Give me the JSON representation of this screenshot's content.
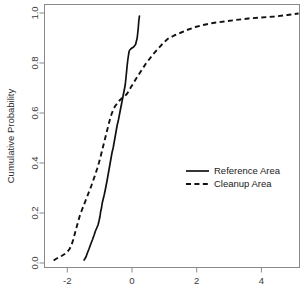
{
  "chart_data": {
    "type": "line",
    "title": "",
    "subtitle": "",
    "xlabel": "",
    "ylabel": "Cumulative Probability",
    "xlim": [
      -2.72,
      5.2
    ],
    "ylim": [
      0.0,
      1.0
    ],
    "grid": false,
    "legend_position": "center-right",
    "xticks": [
      -2,
      0,
      2,
      4
    ],
    "xtick_labels": [
      "-2",
      "0",
      "2",
      "4"
    ],
    "yticks": [
      0.0,
      0.2,
      0.4,
      0.6,
      0.8,
      1.0
    ],
    "ytick_labels": [
      "0.0",
      "0.2",
      "0.4",
      "0.6",
      "0.8",
      "1.0"
    ],
    "series": [
      {
        "name": "Reference Area",
        "style": "solid",
        "color": "#111111",
        "x": [
          -1.48,
          -1.42,
          -1.38,
          -1.33,
          -1.28,
          -1.22,
          -1.17,
          -1.13,
          -1.09,
          -1.05,
          -1.02,
          -0.99,
          -0.97,
          -0.94,
          -0.92,
          -0.89,
          -0.86,
          -0.83,
          -0.8,
          -0.77,
          -0.74,
          -0.71,
          -0.68,
          -0.65,
          -0.62,
          -0.58,
          -0.55,
          -0.52,
          -0.49,
          -0.46,
          -0.42,
          -0.39,
          -0.36,
          -0.33,
          -0.3,
          -0.27,
          -0.24,
          -0.21,
          -0.19,
          -0.17,
          -0.15,
          -0.13,
          -0.11,
          -0.09,
          -0.07,
          -0.04,
          0.0,
          0.05,
          0.11,
          0.16,
          0.19,
          0.21,
          0.23
        ],
        "y": [
          0.012,
          0.025,
          0.04,
          0.056,
          0.074,
          0.094,
          0.112,
          0.128,
          0.14,
          0.152,
          0.168,
          0.186,
          0.205,
          0.222,
          0.24,
          0.256,
          0.272,
          0.29,
          0.31,
          0.33,
          0.352,
          0.374,
          0.396,
          0.418,
          0.44,
          0.462,
          0.484,
          0.506,
          0.528,
          0.55,
          0.572,
          0.592,
          0.612,
          0.632,
          0.652,
          0.672,
          0.692,
          0.712,
          0.736,
          0.762,
          0.79,
          0.812,
          0.83,
          0.846,
          0.852,
          0.856,
          0.86,
          0.864,
          0.874,
          0.9,
          0.935,
          0.968,
          0.988
        ]
      },
      {
        "name": "Cleanup Area",
        "style": "dashed",
        "color": "#111111",
        "x": [
          -2.42,
          -2.38,
          -2.3,
          -2.18,
          -2.08,
          -2.0,
          -1.93,
          -1.87,
          -1.82,
          -1.77,
          -1.72,
          -1.67,
          -1.62,
          -1.56,
          -1.5,
          -1.44,
          -1.38,
          -1.32,
          -1.26,
          -1.2,
          -1.14,
          -1.08,
          -1.02,
          -0.97,
          -0.92,
          -0.87,
          -0.82,
          -0.77,
          -0.72,
          -0.67,
          -0.62,
          -0.57,
          -0.52,
          -0.46,
          -0.4,
          -0.34,
          -0.28,
          -0.22,
          -0.16,
          -0.1,
          -0.04,
          0.04,
          0.12,
          0.22,
          0.32,
          0.42,
          0.54,
          0.66,
          0.8,
          0.94,
          1.1,
          1.3,
          1.52,
          1.74,
          1.96,
          2.2,
          2.5,
          2.85,
          3.2,
          3.6,
          4.0,
          4.4,
          4.8,
          5.15
        ],
        "y": [
          0.01,
          0.014,
          0.02,
          0.028,
          0.036,
          0.044,
          0.056,
          0.072,
          0.092,
          0.116,
          0.14,
          0.164,
          0.186,
          0.208,
          0.228,
          0.248,
          0.268,
          0.288,
          0.308,
          0.33,
          0.352,
          0.376,
          0.402,
          0.426,
          0.452,
          0.478,
          0.504,
          0.53,
          0.556,
          0.58,
          0.6,
          0.616,
          0.628,
          0.638,
          0.648,
          0.656,
          0.662,
          0.668,
          0.676,
          0.688,
          0.702,
          0.718,
          0.736,
          0.756,
          0.776,
          0.796,
          0.816,
          0.836,
          0.856,
          0.876,
          0.896,
          0.91,
          0.922,
          0.934,
          0.944,
          0.952,
          0.96,
          0.966,
          0.972,
          0.978,
          0.982,
          0.986,
          0.992,
          0.998
        ]
      }
    ],
    "legend": [
      {
        "label": "Reference Area",
        "style": "solid"
      },
      {
        "label": "Cleanup Area",
        "style": "dashed"
      }
    ],
    "colors": {
      "line": "#111111",
      "axis": "#8a8a8a",
      "text": "#2b2b2b",
      "background": "#ffffff"
    }
  }
}
